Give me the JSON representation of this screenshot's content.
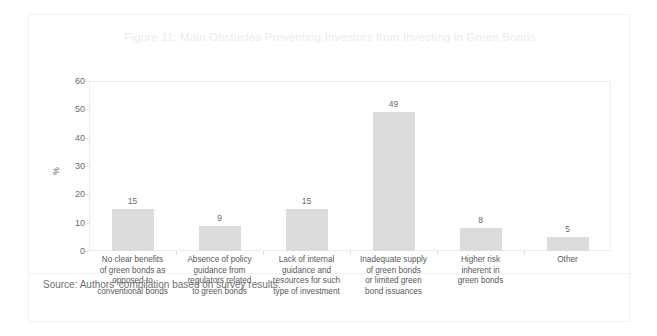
{
  "figure": {
    "title": "Figure 11: Main Obstacles Preventing Investors from Investing in Green Bonds",
    "source_note": "Source: Authors' compilation based on survey results."
  },
  "colors": {
    "bar_fill": "#dcdcdc",
    "title_text": "#ebebeb",
    "axis_text": "#6b6b6b",
    "category_text": "#585858",
    "frame_border": "#ededed",
    "card_border": "#f2f2f2"
  },
  "chart_data": {
    "type": "bar",
    "title": "Figure 11: Main Obstacles Preventing Investors from Investing in Green Bonds",
    "categories": [
      "No clear benefits of green bonds as opposed to conventional bonds",
      "Absence of policy guidance from regulators related to green bonds",
      "Lack of internal guidance and resources for such type of investment",
      "Inadequate supply of green bonds or limited green bond issuances",
      "Higher risk inherent in green bonds",
      "Other"
    ],
    "category_lines": [
      [
        "No clear benefits",
        "of green bonds as",
        "opposed to",
        "conventional bonds"
      ],
      [
        "Absence of policy",
        "guidance from",
        "regulators related",
        "to green bonds"
      ],
      [
        "Lack of internal",
        "guidance and",
        "resources for such",
        "type of investment"
      ],
      [
        "Inadequate supply",
        "of green bonds",
        "or limited green",
        "bond issuances"
      ],
      [
        "Higher risk",
        "inherent in",
        "green bonds"
      ],
      [
        "Other"
      ]
    ],
    "values": [
      15,
      9,
      15,
      49,
      8,
      5
    ],
    "value_labels": [
      "15",
      "9",
      "15",
      "49",
      "8",
      "5"
    ],
    "xlabel": "",
    "ylabel": "%",
    "ylim": [
      0,
      60
    ],
    "yticks": [
      0,
      10,
      20,
      30,
      40,
      50,
      60
    ],
    "ytick_labels": [
      "0",
      "10",
      "20",
      "30",
      "40",
      "50",
      "60"
    ],
    "grid": false,
    "legend": false
  }
}
